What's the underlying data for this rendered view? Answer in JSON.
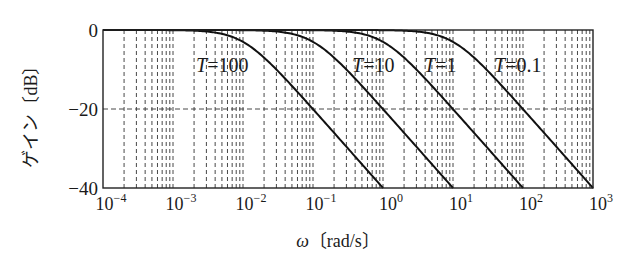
{
  "chart_data": {
    "type": "line",
    "title": "",
    "xlabel": "ω〔rad/s〕",
    "xlabel_symbol": "ω",
    "xlabel_unit": "〔rad/s〕",
    "ylabel": "ゲイン〔dB〕",
    "xscale": "log",
    "xlim": [
      0.0001,
      1000
    ],
    "ylim": [
      -40,
      0
    ],
    "x_ticks": [
      {
        "exp": "-4",
        "value": 0.0001
      },
      {
        "exp": "-3",
        "value": 0.001
      },
      {
        "exp": "-2",
        "value": 0.01
      },
      {
        "exp": "-1",
        "value": 0.1
      },
      {
        "exp": "0",
        "value": 1
      },
      {
        "exp": "1",
        "value": 10
      },
      {
        "exp": "2",
        "value": 100
      },
      {
        "exp": "3",
        "value": 1000
      }
    ],
    "y_ticks": [
      {
        "label": "0",
        "value": 0
      },
      {
        "label": "−20",
        "value": -20
      },
      {
        "label": "−40",
        "value": -40
      }
    ],
    "grid": {
      "x_minor_dashed": true,
      "y_dashed_at": [
        -20
      ]
    },
    "model": "G(jω) = 1/(1 + jωT), gain = −10·log10(1 + (ωT)²)",
    "series": [
      {
        "name": "T=100",
        "T": 100,
        "label": "T = 100",
        "corner_rad_s": 0.01,
        "label_pos": {
          "x": 196,
          "y": 72
        },
        "x": [
          0.0001,
          0.001,
          0.01,
          0.03,
          0.1,
          0.3,
          1
        ],
        "values": [
          0,
          -0.04,
          -3.0,
          -10.0,
          -20.0,
          -29.5,
          -40.0
        ]
      },
      {
        "name": "T=10",
        "T": 10,
        "label": "T = 10",
        "corner_rad_s": 0.1,
        "label_pos": {
          "x": 352,
          "y": 72
        },
        "x": [
          0.001,
          0.01,
          0.1,
          0.3,
          1,
          3,
          10
        ],
        "values": [
          0,
          -0.04,
          -3.0,
          -10.0,
          -20.0,
          -29.5,
          -40.0
        ]
      },
      {
        "name": "T=1",
        "T": 1,
        "label": "T = 1",
        "corner_rad_s": 1,
        "label_pos": {
          "x": 424,
          "y": 72
        },
        "x": [
          0.01,
          0.1,
          1,
          3,
          10,
          30,
          100
        ],
        "values": [
          0,
          -0.04,
          -3.0,
          -10.0,
          -20.0,
          -29.5,
          -40.0
        ]
      },
      {
        "name": "T=0.1",
        "T": 0.1,
        "label": "T = 0.1",
        "corner_rad_s": 10,
        "label_pos": {
          "x": 494,
          "y": 72
        },
        "x": [
          0.1,
          1,
          10,
          30,
          100,
          300,
          1000
        ],
        "values": [
          0,
          -0.04,
          -3.0,
          -10.0,
          -20.0,
          -29.5,
          -40.0
        ]
      }
    ]
  }
}
